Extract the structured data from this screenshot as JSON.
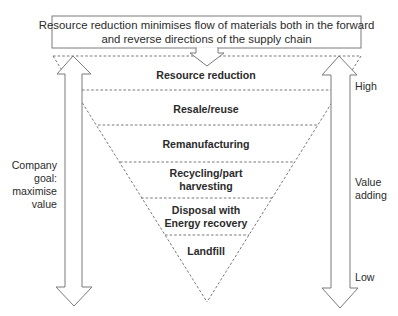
{
  "diagram": {
    "title_box": {
      "lines": [
        "Resource reduction minimises flow of materials both in the forward",
        "and reverse directions of the supply chain"
      ]
    },
    "hierarchy_layers": [
      {
        "label_lines": [
          "Resource reduction"
        ]
      },
      {
        "label_lines": [
          "Resale/reuse"
        ]
      },
      {
        "label_lines": [
          "Remanufacturing"
        ]
      },
      {
        "label_lines": [
          "Recycling/part",
          "harvesting"
        ]
      },
      {
        "label_lines": [
          "Disposal with",
          "Energy recovery"
        ]
      },
      {
        "label_lines": [
          "Landfill"
        ]
      }
    ],
    "left_arrow": {
      "icon": "double-headed-vertical-arrow-icon",
      "label_lines": [
        "Company",
        "goal:",
        "maximise",
        "value"
      ]
    },
    "right_arrow": {
      "icon": "double-headed-vertical-arrow-icon",
      "top_label": "High",
      "middle_label_lines": [
        "Value",
        "adding"
      ],
      "bottom_label": "Low"
    },
    "colors": {
      "line": "#7a7a7a",
      "text": "#2b2b2b",
      "background": "#ffffff"
    }
  }
}
